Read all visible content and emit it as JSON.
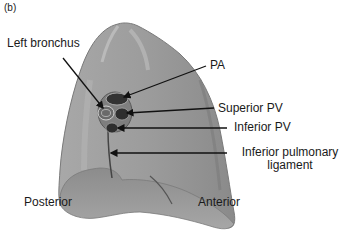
{
  "figure": {
    "panel_label": "(b)"
  },
  "labels": {
    "left_bronchus": "Left bronchus",
    "pa": "PA",
    "superior_pv": "Superior PV",
    "inferior_pv": "Inferior PV",
    "inferior_pulmonary_ligament_line1": "Inferior pulmonary",
    "inferior_pulmonary_ligament_line2": "ligament",
    "posterior": "Posterior",
    "anterior": "Anterior"
  },
  "colors": {
    "lung_fill": "#9a9a9a",
    "lung_light": "#b5b5b5",
    "lung_dark": "#6e6e6e",
    "hilum_dark": "#3a3a3a",
    "arrow": "#111111",
    "text": "#1a1a1a"
  }
}
